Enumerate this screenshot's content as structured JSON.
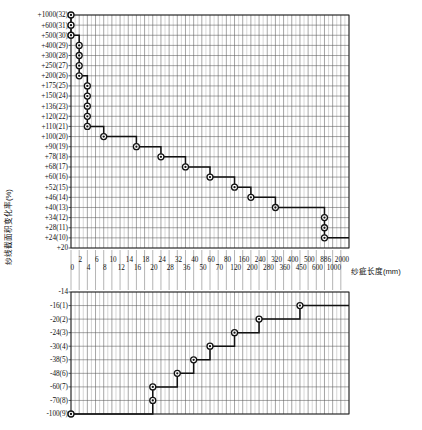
{
  "chart_data": {
    "type": "line",
    "title": "",
    "xlabel": "纱疵长度(mm)",
    "ylabel": "纱线截面积变化率(%)",
    "grid": true,
    "legend": "none",
    "x_tick_labels": [
      "0",
      "2",
      "4",
      "6",
      "8",
      "10",
      "12",
      "14",
      "16",
      "18",
      "20",
      "24",
      "28",
      "32",
      "36",
      "40",
      "50",
      "60",
      "70",
      "80",
      "120",
      "160",
      "200",
      "240",
      "280",
      "320",
      "360",
      "400",
      "450",
      "500",
      "600",
      "886",
      "1000",
      "2000"
    ],
    "y_tick_labels_upper": [
      "+1000(32)",
      "+600(31)",
      "+500(30)",
      "+400(29)",
      "+300(28)",
      "+250(27)",
      "+200(26)",
      "+175(25)",
      "+150(24)",
      "+136(23)",
      "+120(22)",
      "+110(21)",
      "+100(20)",
      "+90(19)",
      "+78(18)",
      "+68(17)",
      "+60(16)",
      "+52(15)",
      "+46(14)",
      "+40(13)",
      "+34(12)",
      "+28(11)",
      "+24(10)",
      "+20"
    ],
    "y_tick_labels_lower": [
      "-14",
      "-16(1)",
      "-20(2)",
      "-24(3)",
      "-30(4)",
      "-38(5)",
      "-48(6)",
      "-60(7)",
      "-70(8)",
      "-100(9)"
    ],
    "series": [
      {
        "name": "upper-step",
        "points": [
          {
            "x": "0",
            "y": "+1000(32)"
          },
          {
            "x": "0",
            "y": "+600(31)"
          },
          {
            "x": "0",
            "y": "+500(30)"
          },
          {
            "x": "2",
            "y": "+400(29)"
          },
          {
            "x": "2",
            "y": "+300(28)"
          },
          {
            "x": "2",
            "y": "+250(27)"
          },
          {
            "x": "2",
            "y": "+200(26)"
          },
          {
            "x": "4",
            "y": "+175(25)"
          },
          {
            "x": "4",
            "y": "+150(24)"
          },
          {
            "x": "4",
            "y": "+136(23)"
          },
          {
            "x": "4",
            "y": "+120(22)"
          },
          {
            "x": "4",
            "y": "+110(21)"
          },
          {
            "x": "8",
            "y": "+100(20)"
          },
          {
            "x": "16",
            "y": "+90(19)"
          },
          {
            "x": "24",
            "y": "+78(18)"
          },
          {
            "x": "36",
            "y": "+68(17)"
          },
          {
            "x": "60",
            "y": "+60(16)"
          },
          {
            "x": "120",
            "y": "+52(15)"
          },
          {
            "x": "200",
            "y": "+46(14)"
          },
          {
            "x": "320",
            "y": "+40(13)"
          },
          {
            "x": "886",
            "y": "+34(12)"
          },
          {
            "x": "886",
            "y": "+28(11)"
          },
          {
            "x": "886",
            "y": "+24(10)"
          }
        ]
      },
      {
        "name": "lower-step",
        "points": [
          {
            "x": "0",
            "y": "-100(9)"
          },
          {
            "x": "20",
            "y": "-70(8)"
          },
          {
            "x": "20",
            "y": "-60(7)"
          },
          {
            "x": "32",
            "y": "-48(6)"
          },
          {
            "x": "40",
            "y": "-38(5)"
          },
          {
            "x": "60",
            "y": "-30(4)"
          },
          {
            "x": "120",
            "y": "-24(3)"
          },
          {
            "x": "240",
            "y": "-20(2)"
          },
          {
            "x": "450",
            "y": "-16(1)"
          }
        ]
      }
    ]
  },
  "axes": {
    "y_title": "纱线截面积变化率(%)",
    "x_title": "纱疵长度(mm)"
  }
}
